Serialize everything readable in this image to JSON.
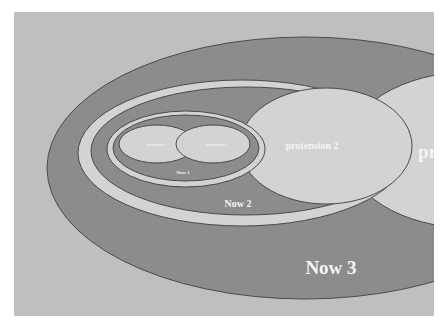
{
  "diagram": {
    "type": "nested-ellipses",
    "colors": {
      "background": "#bfbfbf",
      "dark_fill": "#8c8c8c",
      "light_fill": "#d3d3d3",
      "stroke": "#4a4a4a",
      "label": "#f4f4f4"
    },
    "labels": {
      "retention_1": "retention 1",
      "protension_1": "protension 1",
      "now_1": "Now 1",
      "protension_2": "protension 2",
      "now_2": "Now 2",
      "protension_3_partial": "pr",
      "now_3": "Now 3"
    }
  }
}
